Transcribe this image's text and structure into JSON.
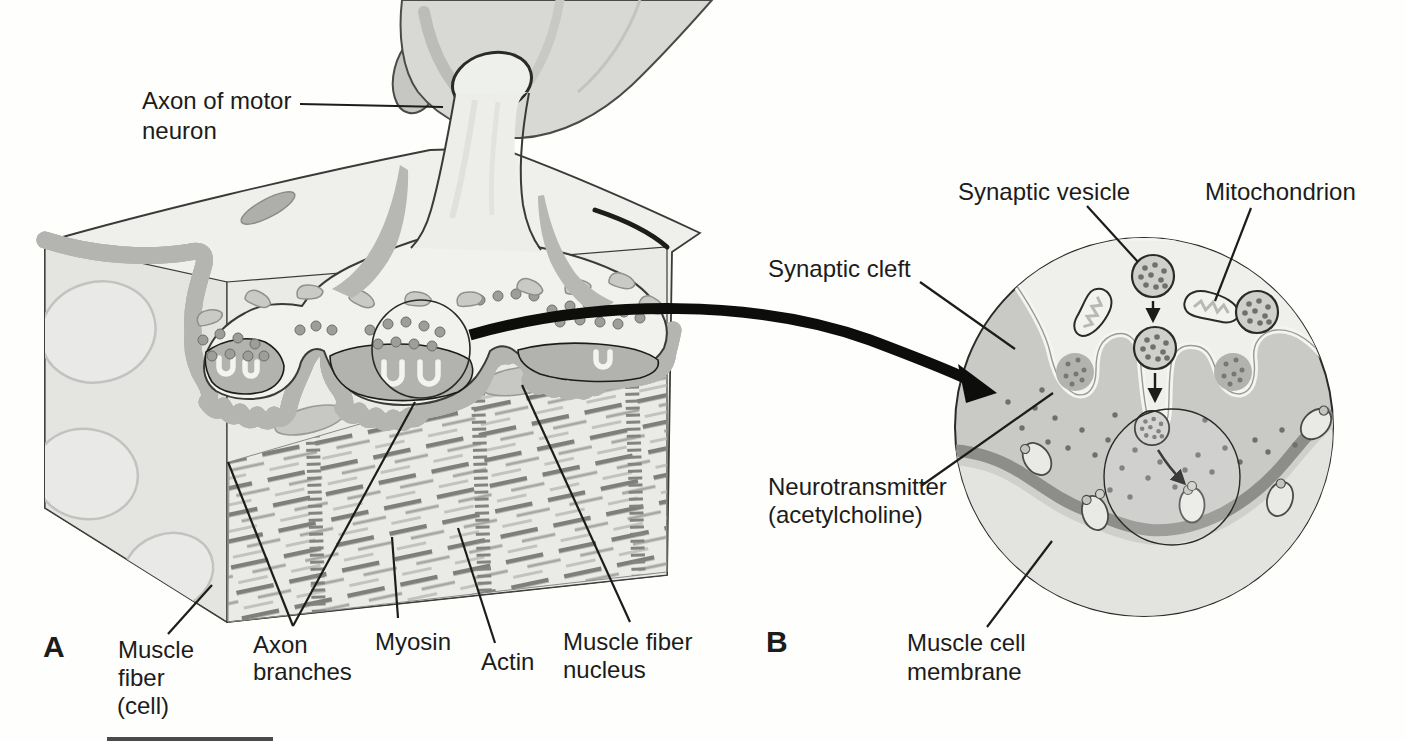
{
  "figure": {
    "panel_a": {
      "letter": "A",
      "labels": {
        "axon_of_motor_neuron": {
          "line1": "Axon of motor",
          "line2": "neuron"
        },
        "muscle_fiber_cell": {
          "line1": "Muscle",
          "line2": "fiber",
          "line3": "(cell)"
        },
        "axon_branches": {
          "line1": "Axon",
          "line2": "branches"
        },
        "myosin": "Myosin",
        "actin": "Actin",
        "muscle_fiber_nucleus": {
          "line1": "Muscle fiber",
          "line2": "nucleus"
        }
      }
    },
    "panel_b": {
      "letter": "B",
      "labels": {
        "synaptic_vesicle": "Synaptic vesicle",
        "mitochondrion": "Mitochondrion",
        "synaptic_cleft": "Synaptic cleft",
        "neurotransmitter": {
          "line1": "Neurotransmitter",
          "line2": "(acetylcholine)"
        },
        "muscle_cell_membrane": {
          "line1": "Muscle cell",
          "line2": "membrane"
        }
      }
    },
    "colors": {
      "paper": "#fefefd",
      "ink": "#1c1c1a",
      "muscle_surface": "#eff0ec",
      "muscle_front": "#eaebe7",
      "muscle_side": "#e4e5e1",
      "terminal_fill": "#f1f2ee",
      "synaptic_gutter_gray": "#b4b5b1",
      "cleft_gray": "#c9cac6",
      "membrane_band": "#8d8e8a",
      "vesicle_gray": "#9d9e9a",
      "nerve_trunk": "#d8d9d5",
      "striation_dark": "#7e7f7a",
      "striation_light": "#a6a7a2"
    }
  }
}
